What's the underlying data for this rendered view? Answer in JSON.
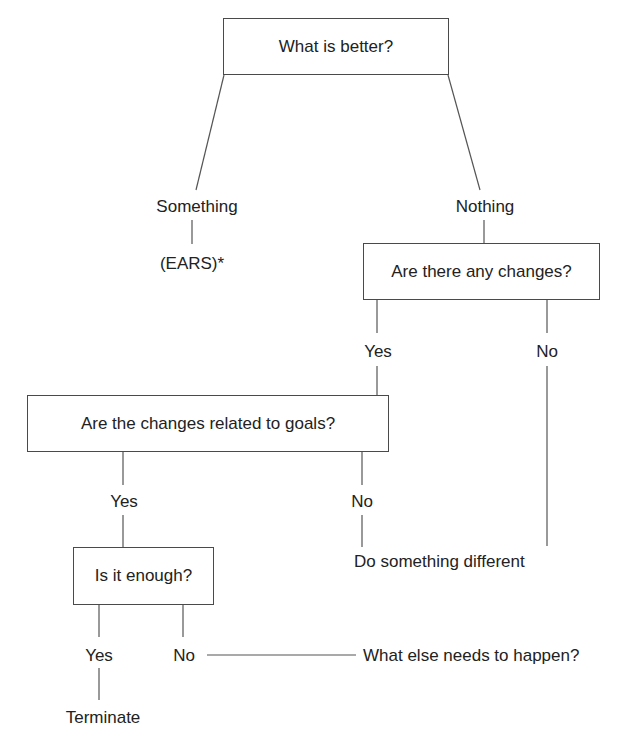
{
  "diagram": {
    "type": "decision-tree",
    "nodes": {
      "root": {
        "label": "What is better?",
        "shape": "box"
      },
      "something": {
        "label": "Something",
        "shape": "text"
      },
      "ears": {
        "label": "(EARS)*",
        "shape": "text"
      },
      "nothing": {
        "label": "Nothing",
        "shape": "text"
      },
      "any_changes": {
        "label": "Are there any changes?",
        "shape": "box"
      },
      "changes_yes": {
        "label": "Yes",
        "shape": "text"
      },
      "changes_no": {
        "label": "No",
        "shape": "text"
      },
      "goals": {
        "label": "Are the changes related to goals?",
        "shape": "box"
      },
      "goals_yes": {
        "label": "Yes",
        "shape": "text"
      },
      "goals_no": {
        "label": "No",
        "shape": "text"
      },
      "do_different": {
        "label": "Do something different",
        "shape": "text"
      },
      "enough": {
        "label": "Is it enough?",
        "shape": "box"
      },
      "enough_yes": {
        "label": "Yes",
        "shape": "text"
      },
      "enough_no": {
        "label": "No",
        "shape": "text"
      },
      "what_else": {
        "label": "What else needs to happen?",
        "shape": "text"
      },
      "terminate": {
        "label": "Terminate",
        "shape": "text"
      }
    },
    "edges": [
      [
        "root",
        "something"
      ],
      [
        "root",
        "nothing"
      ],
      [
        "something",
        "ears"
      ],
      [
        "nothing",
        "any_changes"
      ],
      [
        "any_changes",
        "changes_yes"
      ],
      [
        "any_changes",
        "changes_no"
      ],
      [
        "changes_yes",
        "goals"
      ],
      [
        "changes_no",
        "do_different"
      ],
      [
        "goals",
        "goals_yes"
      ],
      [
        "goals",
        "goals_no"
      ],
      [
        "goals_no",
        "do_different"
      ],
      [
        "goals_yes",
        "enough"
      ],
      [
        "enough",
        "enough_yes"
      ],
      [
        "enough",
        "enough_no"
      ],
      [
        "enough_no",
        "what_else"
      ],
      [
        "enough_yes",
        "terminate"
      ]
    ]
  }
}
